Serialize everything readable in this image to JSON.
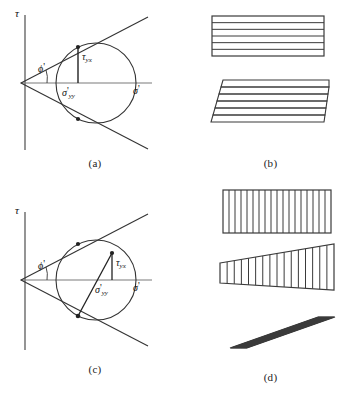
{
  "figure": {
    "panels": [
      {
        "id": "a",
        "caption": "(a)",
        "type": "mohr-circle-diagram",
        "axis_tau": "τ",
        "axis_sigma": "σ",
        "axis_sigma_prime": "'",
        "angle_label": "ϕ",
        "angle_prime": "'",
        "tau_label": "τ",
        "tau_sub": "yx",
        "sigma_label": "σ",
        "sigma_sub": "yy",
        "sigma_prime_mark": "'"
      },
      {
        "id": "b",
        "caption": "(b)",
        "type": "layered-block-deformation",
        "blocks": [
          {
            "name": "undeformed-layered-block",
            "shape": "rectangle",
            "layers": 6,
            "orientation": "horizontal"
          },
          {
            "name": "slipped-layered-block",
            "shape": "stepped-slip",
            "layers": 6,
            "orientation": "horizontal"
          }
        ]
      },
      {
        "id": "c",
        "caption": "(c)",
        "type": "mohr-circle-diagram",
        "axis_tau": "τ",
        "axis_sigma": "σ",
        "axis_sigma_prime": "'",
        "angle_label": "ϕ",
        "angle_prime": "'",
        "tau_label": "τ",
        "tau_sub": "yx",
        "sigma_label": "σ",
        "sigma_sub": "yy",
        "sigma_prime_mark": "'"
      },
      {
        "id": "d",
        "caption": "(d)",
        "type": "columnar-block-deformation",
        "blocks": [
          {
            "name": "undeformed-columnar-block",
            "shape": "rectangle",
            "columns": 18,
            "orientation": "vertical"
          },
          {
            "name": "tapered-columnar-block",
            "shape": "wedge",
            "columns": 16,
            "orientation": "vertical"
          },
          {
            "name": "sheared-columnar-block",
            "shape": "parallelogram",
            "columns": 20,
            "orientation": "slanted"
          }
        ]
      }
    ],
    "colors": {
      "line": "#3a3a3a",
      "axis": "#6b6b6b",
      "background": "#ffffff"
    }
  }
}
